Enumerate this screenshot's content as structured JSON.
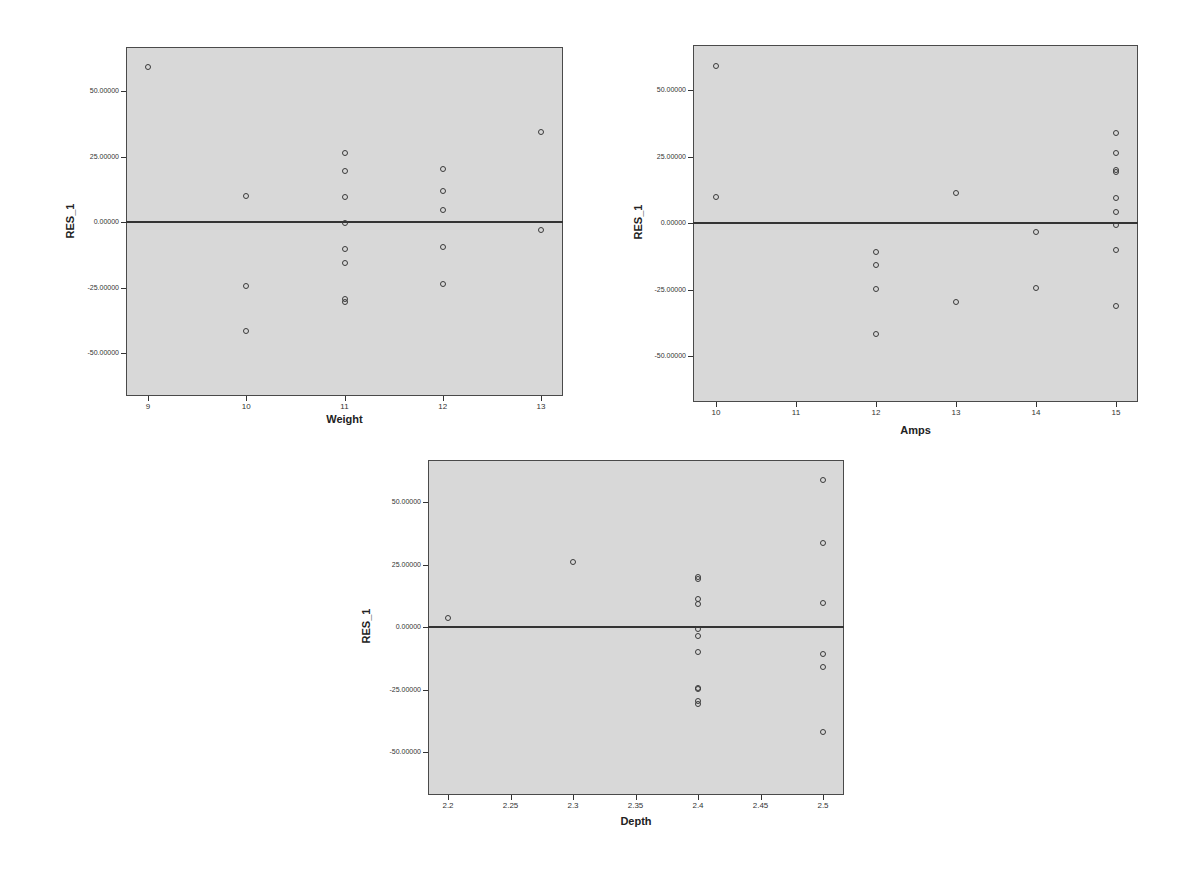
{
  "chart_data": [
    {
      "type": "scatter",
      "title": "",
      "xlabel": "Weight",
      "ylabel": "RES_1",
      "xticks": [
        "9",
        "10",
        "11",
        "12",
        "13"
      ],
      "yticks": [
        "50.00000",
        "25.00000",
        "0.00000",
        "-25.00000",
        "-50.00000"
      ],
      "ylim": [
        -66,
        66
      ],
      "xlim": [
        8.8,
        13.2
      ],
      "reference_line": {
        "y": 0
      },
      "grid": false,
      "points": [
        {
          "x": 9,
          "y": 59.0
        },
        {
          "x": 10,
          "y": 9.9
        },
        {
          "x": 10,
          "y": -24.3
        },
        {
          "x": 10,
          "y": -41.6
        },
        {
          "x": 11,
          "y": 26.4
        },
        {
          "x": 11,
          "y": 19.5
        },
        {
          "x": 11,
          "y": 9.4
        },
        {
          "x": 11,
          "y": -0.5
        },
        {
          "x": 11,
          "y": -10.4
        },
        {
          "x": 11,
          "y": -15.5
        },
        {
          "x": 11,
          "y": -29.2
        },
        {
          "x": 11,
          "y": -30.4
        },
        {
          "x": 12,
          "y": 20.4
        },
        {
          "x": 12,
          "y": 11.7
        },
        {
          "x": 12,
          "y": 4.4
        },
        {
          "x": 12,
          "y": -9.5
        },
        {
          "x": 12,
          "y": -23.8
        },
        {
          "x": 13,
          "y": 34.2
        },
        {
          "x": 13,
          "y": -3.0
        }
      ]
    },
    {
      "type": "scatter",
      "title": "",
      "xlabel": "Amps",
      "ylabel": "RES_1",
      "xticks": [
        "10",
        "11",
        "12",
        "13",
        "14",
        "15"
      ],
      "yticks": [
        "50.00000",
        "25.00000",
        "0.00000",
        "-25.00000",
        "-50.00000"
      ],
      "ylim": [
        -66,
        66
      ],
      "xlim": [
        9.7,
        15.3
      ],
      "reference_line": {
        "y": 0
      },
      "grid": false,
      "points": [
        {
          "x": 10,
          "y": 59.0
        },
        {
          "x": 10,
          "y": 9.6
        },
        {
          "x": 12,
          "y": -10.8
        },
        {
          "x": 12,
          "y": -15.9
        },
        {
          "x": 12,
          "y": -24.8
        },
        {
          "x": 12,
          "y": -41.9
        },
        {
          "x": 13,
          "y": 11.4
        },
        {
          "x": 13,
          "y": -29.6
        },
        {
          "x": 14,
          "y": -3.5
        },
        {
          "x": 14,
          "y": -24.4
        },
        {
          "x": 15,
          "y": 33.8
        },
        {
          "x": 15,
          "y": 26.3
        },
        {
          "x": 15,
          "y": 20.0
        },
        {
          "x": 15,
          "y": 19.3
        },
        {
          "x": 15,
          "y": 9.3
        },
        {
          "x": 15,
          "y": 4.0
        },
        {
          "x": 15,
          "y": -0.9
        },
        {
          "x": 15,
          "y": -10.0
        },
        {
          "x": 15,
          "y": -31.1
        }
      ]
    },
    {
      "type": "scatter",
      "title": "",
      "xlabel": "Depth",
      "ylabel": "RES_1",
      "xticks": [
        "2.2",
        "2.25",
        "2.3",
        "2.35",
        "2.4",
        "2.45",
        "2.5"
      ],
      "yticks": [
        "50.00000",
        "25.00000",
        "0.00000",
        "-25.00000",
        "-50.00000"
      ],
      "ylim": [
        -66,
        66
      ],
      "xlim": [
        2.184,
        2.517
      ],
      "reference_line": {
        "y": 0
      },
      "grid": false,
      "points": [
        {
          "x": 2.2,
          "y": 3.8
        },
        {
          "x": 2.3,
          "y": 26.1
        },
        {
          "x": 2.4,
          "y": 19.9
        },
        {
          "x": 2.4,
          "y": 19.2
        },
        {
          "x": 2.4,
          "y": 11.3
        },
        {
          "x": 2.4,
          "y": 9.2
        },
        {
          "x": 2.4,
          "y": -0.9
        },
        {
          "x": 2.4,
          "y": -3.4
        },
        {
          "x": 2.4,
          "y": -9.9
        },
        {
          "x": 2.4,
          "y": -24.5
        },
        {
          "x": 2.4,
          "y": -24.8
        },
        {
          "x": 2.4,
          "y": -29.4
        },
        {
          "x": 2.4,
          "y": -30.9
        },
        {
          "x": 2.5,
          "y": 58.7
        },
        {
          "x": 2.5,
          "y": 33.7
        },
        {
          "x": 2.5,
          "y": 9.7
        },
        {
          "x": 2.5,
          "y": -10.9
        },
        {
          "x": 2.5,
          "y": -15.9
        },
        {
          "x": 2.5,
          "y": -41.8
        }
      ]
    }
  ],
  "charts": [
    {
      "xlabel": "Weight",
      "ylabel": "RES_1"
    },
    {
      "xlabel": "Amps",
      "ylabel": "RES_1"
    },
    {
      "xlabel": "Depth",
      "ylabel": "RES_1"
    }
  ],
  "colors": {
    "plot_background": "#d8d8d8",
    "border": "#4a4a4a",
    "marker": "#3a3a3a",
    "reference_line": "#333333"
  }
}
